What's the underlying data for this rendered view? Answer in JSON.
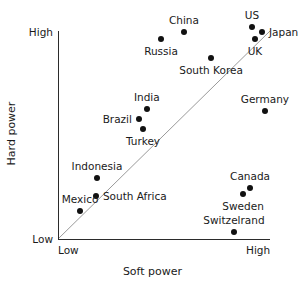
{
  "chart_data": {
    "type": "scatter",
    "title": "",
    "xlabel": "Soft power",
    "ylabel": "Hard power",
    "xlim": [
      0,
      1
    ],
    "ylim": [
      0,
      1
    ],
    "grid": false,
    "legend": "none",
    "x_ticks": [
      "Low",
      "High"
    ],
    "y_ticks": [
      "Low",
      "High"
    ],
    "annotations": [
      {
        "name": "parity-diagonal",
        "description": "45-degree reference line from origin",
        "x1": 0.0,
        "y1": 0.0,
        "x2": 1.0,
        "y2": 1.0
      }
    ],
    "points": [
      {
        "label": "China",
        "x": 0.594,
        "y": 0.995,
        "label_pos": "above"
      },
      {
        "label": "Russia",
        "x": 0.486,
        "y": 0.962,
        "label_pos": "below"
      },
      {
        "label": "US",
        "x": 0.915,
        "y": 1.019,
        "label_pos": "above"
      },
      {
        "label": "Japan",
        "x": 0.962,
        "y": 0.995,
        "label_pos": "right"
      },
      {
        "label": "UK",
        "x": 0.929,
        "y": 0.962,
        "label_pos": "below"
      },
      {
        "label": "South Korea",
        "x": 0.722,
        "y": 0.871,
        "label_pos": "below"
      },
      {
        "label": "Germany",
        "x": 0.976,
        "y": 0.617,
        "label_pos": "above"
      },
      {
        "label": "India",
        "x": 0.419,
        "y": 0.627,
        "label_pos": "above"
      },
      {
        "label": "Brazil",
        "x": 0.382,
        "y": 0.579,
        "label_pos": "left"
      },
      {
        "label": "Turkey",
        "x": 0.401,
        "y": 0.531,
        "label_pos": "below"
      },
      {
        "label": "Indonesia",
        "x": 0.184,
        "y": 0.292,
        "label_pos": "above"
      },
      {
        "label": "South Africa",
        "x": 0.179,
        "y": 0.206,
        "label_pos": "right"
      },
      {
        "label": "Mexico",
        "x": 0.104,
        "y": 0.134,
        "label_pos": "above"
      },
      {
        "label": "Canada",
        "x": 0.906,
        "y": 0.244,
        "label_pos": "above"
      },
      {
        "label": "Sweden",
        "x": 0.873,
        "y": 0.215,
        "label_pos": "below"
      },
      {
        "label": "Switzelrand",
        "x": 0.83,
        "y": 0.033,
        "label_pos": "above"
      }
    ]
  },
  "axes": {
    "x_title": "Soft power",
    "y_title": "Hard power",
    "x_low": "Low",
    "x_high": "High",
    "y_low": "Low",
    "y_high": "High"
  },
  "colors": {
    "point": "#111111",
    "axis": "#2b2b2b",
    "diagonal": "#9a9a9a",
    "text": "#1a1a1a",
    "background": "#ffffff"
  }
}
